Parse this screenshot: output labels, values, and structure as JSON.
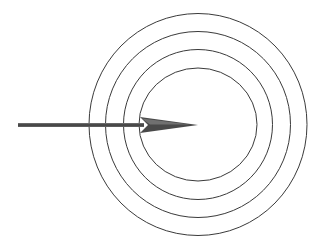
{
  "diagram": {
    "background": "#ffffff",
    "rings": {
      "stroke": "#3a3a3a",
      "stroke_width": 1,
      "center": [
        198,
        124.5
      ],
      "items": [
        {
          "name": "outer-ring",
          "rx": 109,
          "ry": 111
        },
        {
          "name": "second-ring",
          "rx": 92.5,
          "ry": 93
        },
        {
          "name": "third-ring",
          "rx": 74.5,
          "ry": 75
        },
        {
          "name": "inner-ring",
          "rx": 59,
          "ry": 56.5
        }
      ]
    },
    "arrow": {
      "color": "#4a4a4a",
      "start": [
        18,
        125
      ],
      "tip": [
        198,
        125
      ],
      "direction": "right"
    }
  }
}
